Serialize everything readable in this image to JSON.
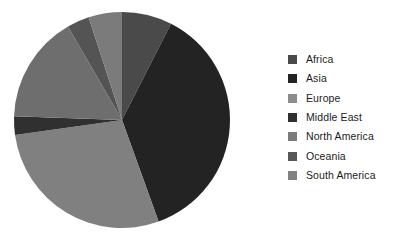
{
  "chart_data": {
    "type": "pie",
    "title": "",
    "subtitle": "",
    "xlabel": "",
    "ylabel": "",
    "grid": false,
    "legend_position": "right",
    "start_angle_deg": 0,
    "direction": "clockwise",
    "center": {
      "x": 122,
      "y": 120
    },
    "radius": 108,
    "categories": [
      "Africa",
      "Asia",
      "Europe",
      "Middle East",
      "North America",
      "Oceania",
      "South America"
    ],
    "values": [
      7.5,
      37.0,
      28.3,
      2.8,
      16.1,
      3.3,
      5.0
    ],
    "slices": [
      {
        "label": "Africa",
        "value": 7.5,
        "percent": 7.5,
        "color": "#4a4a4a",
        "start_deg": 0.0,
        "end_deg": 27.0
      },
      {
        "label": "Asia",
        "value": 37.0,
        "percent": 37.0,
        "color": "#232323",
        "start_deg": 27.0,
        "end_deg": 160.2
      },
      {
        "label": "Europe",
        "value": 28.3,
        "percent": 28.3,
        "color": "#808080",
        "start_deg": 160.2,
        "end_deg": 262.0
      },
      {
        "label": "Middle East",
        "value": 2.8,
        "percent": 2.8,
        "color": "#303030",
        "start_deg": 262.0,
        "end_deg": 272.0
      },
      {
        "label": "North America",
        "value": 16.1,
        "percent": 16.1,
        "color": "#6e6e6e",
        "start_deg": 272.0,
        "end_deg": 330.0
      },
      {
        "label": "Oceania",
        "value": 3.3,
        "percent": 3.3,
        "color": "#545454",
        "start_deg": 330.0,
        "end_deg": 342.0
      },
      {
        "label": "South America",
        "value": 5.0,
        "percent": 5.0,
        "color": "#7b7b7b",
        "start_deg": 342.0,
        "end_deg": 360.0
      }
    ]
  },
  "legend": {
    "items": [
      {
        "label": "Africa",
        "color": "#4a4a4a",
        "swatch_name": "legend-swatch-africa"
      },
      {
        "label": "Asia",
        "color": "#232323",
        "swatch_name": "legend-swatch-asia"
      },
      {
        "label": "Europe",
        "color": "#8c8c8c",
        "swatch_name": "legend-swatch-europe"
      },
      {
        "label": "Middle East",
        "color": "#303030",
        "swatch_name": "legend-swatch-middle-east"
      },
      {
        "label": "North America",
        "color": "#7a7a7a",
        "swatch_name": "legend-swatch-north-america"
      },
      {
        "label": "Oceania",
        "color": "#575757",
        "swatch_name": "legend-swatch-oceania"
      },
      {
        "label": "South America",
        "color": "#828282",
        "swatch_name": "legend-swatch-south-america"
      }
    ]
  },
  "colors": {
    "background": "#ffffff",
    "text": "#1b1b1b"
  }
}
